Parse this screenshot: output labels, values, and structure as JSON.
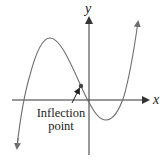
{
  "diagram": {
    "type": "function-graph",
    "axes": {
      "x_label": "x",
      "y_label": "y"
    },
    "curve": {
      "description": "cubic polynomial with local max left of y-axis, local min right of y-axis",
      "color": "#6e6e6e"
    },
    "annotation": {
      "line1": "Inflection",
      "line2": "point"
    },
    "colors": {
      "axis": "#333333",
      "curve": "#6e6e6e",
      "text": "#222222"
    }
  }
}
